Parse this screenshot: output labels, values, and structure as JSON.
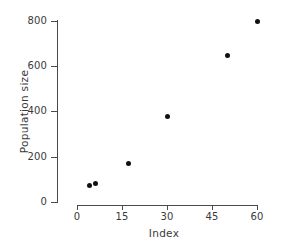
{
  "chart_data": {
    "type": "scatter",
    "title": "",
    "xlabel": "Index",
    "ylabel": "Population size",
    "xlim": [
      0,
      62
    ],
    "ylim": [
      0,
      820
    ],
    "xticks": [
      0,
      15,
      30,
      45,
      60
    ],
    "xtick_labels": [
      "0",
      "15",
      "30",
      "45",
      "60"
    ],
    "yticks": [
      0,
      200,
      400,
      600,
      800
    ],
    "ytick_labels": [
      "0",
      "200",
      "400",
      "600",
      "800"
    ],
    "grid": false,
    "legend": null,
    "marker": "filled-circle",
    "marker_color": "#111111",
    "axis_color": "#4a4a4a",
    "background": "#ffffff",
    "series": [
      {
        "name": "population",
        "points": [
          {
            "x": 4,
            "y": 75
          },
          {
            "x": 6,
            "y": 82
          },
          {
            "x": 17,
            "y": 168
          },
          {
            "x": 30,
            "y": 380
          },
          {
            "x": 50,
            "y": 648
          },
          {
            "x": 60,
            "y": 800
          }
        ]
      }
    ]
  }
}
